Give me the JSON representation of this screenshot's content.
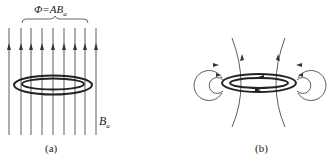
{
  "panel_a": {
    "flux_label": "Φ=AB",
    "flux_subscript": "a",
    "field_label": "B",
    "field_subscript": "a",
    "caption": "(a)",
    "field_line_count": 9,
    "field_direction": "up"
  },
  "panel_b": {
    "caption": "(b)"
  },
  "colors": {
    "line": "#333333",
    "ring": "#222222",
    "background": "#ffffff"
  }
}
